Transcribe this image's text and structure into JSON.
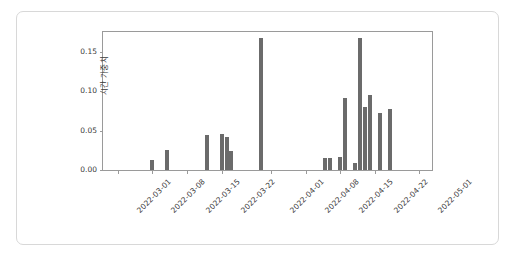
{
  "chart_data": {
    "type": "bar",
    "title": "",
    "xlabel": "",
    "ylabel": "시간 가중치",
    "ylim": [
      0.0,
      0.178
    ],
    "xlim": [
      "2022-02-26",
      "2022-05-04"
    ],
    "grid": false,
    "legend": null,
    "bar_color": "#6b6b6b",
    "y_ticks": [
      "0.00",
      "0.05",
      "0.10",
      "0.15"
    ],
    "y_tick_values": [
      0.0,
      0.05,
      0.1,
      0.15
    ],
    "x_ticks": [
      "2022-03-01",
      "2022-03-08",
      "2022-03-15",
      "2022-03-22",
      "2022-04-01",
      "2022-04-08",
      "2022-04-15",
      "2022-04-22",
      "2022-05-01"
    ],
    "x_tick_values": [
      "2022-03-01",
      "2022-03-08",
      "2022-03-15",
      "2022-03-22",
      "2022-04-01",
      "2022-04-08",
      "2022-04-15",
      "2022-04-22",
      "2022-05-01"
    ],
    "x": [
      "2022-03-08",
      "2022-03-11",
      "2022-03-19",
      "2022-03-22",
      "2022-03-23",
      "2022-03-24",
      "2022-03-30",
      "2022-04-12",
      "2022-04-13",
      "2022-04-15",
      "2022-04-16",
      "2022-04-18",
      "2022-04-19",
      "2022-04-20",
      "2022-04-21",
      "2022-04-23",
      "2022-04-25"
    ],
    "values": [
      0.013,
      0.025,
      0.045,
      0.046,
      0.042,
      0.024,
      0.168,
      0.015,
      0.015,
      0.016,
      0.091,
      0.009,
      0.168,
      0.08,
      0.095,
      0.072,
      0.078
    ]
  }
}
